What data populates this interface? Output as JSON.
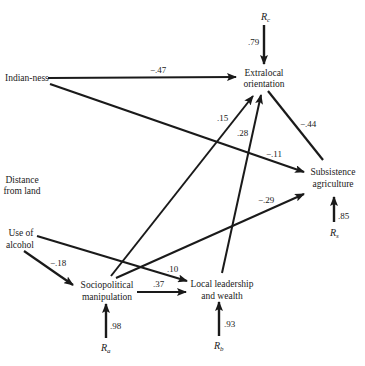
{
  "diagram": {
    "type": "path-diagram",
    "nodes": {
      "indianness": {
        "label": "Indian-ness"
      },
      "distance": {
        "line1": "Distance",
        "line2": "from land"
      },
      "alcohol": {
        "line1": "Use of",
        "line2": "alcohol"
      },
      "extralocal": {
        "line1": "Extralocal",
        "line2": "orientation"
      },
      "subsistence": {
        "line1": "Subsistence",
        "line2": "agriculture"
      },
      "sociopolitical": {
        "line1": "Sociopolitical",
        "line2": "manipulation"
      },
      "local": {
        "line1": "Local leadership",
        "line2": "and wealth"
      }
    },
    "residuals": {
      "rc": {
        "base": "R",
        "sub": "c",
        "coef": ".79"
      },
      "rs": {
        "base": "R",
        "sub": "s",
        "coef": ".85"
      },
      "ra": {
        "base": "R",
        "sub": "a",
        "coef": ".98"
      },
      "rb": {
        "base": "R",
        "sub": "b",
        "coef": ".93"
      }
    },
    "edges": {
      "indian_extralocal": {
        "from": "Indian-ness",
        "to": "Extralocal orientation",
        "coef": "−.47"
      },
      "indian_subsistence": {
        "from": "Indian-ness",
        "to": "Subsistence agriculture",
        "coef": "−.11"
      },
      "extralocal_subsistence": {
        "from": "Extralocal orientation",
        "to": "Subsistence agriculture",
        "coef": "−.44"
      },
      "socio_extralocal": {
        "from": "Sociopolitical manipulation",
        "to": "Extralocal orientation",
        "coef": ".15"
      },
      "local_extralocal": {
        "from": "Local leadership and wealth",
        "to": "Extralocal orientation",
        "coef": ".28"
      },
      "socio_subsistence": {
        "from": "Sociopolitical manipulation",
        "to": "Subsistence agriculture",
        "coef": "−.29"
      },
      "alcohol_local": {
        "from": "Use of alcohol",
        "to": "Local leadership and wealth",
        "coef": ".10"
      },
      "alcohol_socio": {
        "from": "Use of alcohol",
        "to": "Sociopolitical manipulation",
        "coef": "−.18"
      },
      "socio_local": {
        "from": "Sociopolitical manipulation",
        "to": "Local leadership and wealth",
        "coef": ".37"
      }
    }
  }
}
